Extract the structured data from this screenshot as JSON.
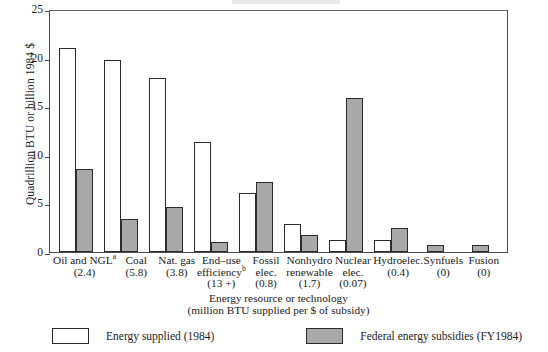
{
  "chart_data": {
    "type": "bar",
    "title": "",
    "xlabel": "Energy resource or technology",
    "xlabel_sub": "(million BTU supplied per $ of subsidy)",
    "ylabel": "Quadrillion BTU or billion 1984 $",
    "ylim": [
      0,
      25
    ],
    "yticks": [
      0,
      5,
      10,
      15,
      20,
      25
    ],
    "grid": false,
    "legend_position": "bottom",
    "categories": [
      "Oil and NGLᵃ",
      "Coal",
      "Nat. gas",
      "End-use efficiencyᵇ",
      "Fossil elec.",
      "Nonhydro renewable",
      "Nuclear elec.",
      "Hydroelec.",
      "Synfuels",
      "Fusion"
    ],
    "category_sublabels": [
      "(2.4)",
      "(5.8)",
      "(3.8)",
      "(13+)",
      "(0.8)",
      "(1.7)",
      "(0.07)",
      "(0.4)",
      "(0)",
      "(0)"
    ],
    "series": [
      {
        "name": "Energy supplied (1984)",
        "color": "#ffffff",
        "values": [
          21.0,
          19.8,
          17.9,
          11.3,
          6.1,
          2.9,
          1.2,
          1.2,
          0,
          0
        ]
      },
      {
        "name": "Federal energy subsidies (FY1984)",
        "color": "#a8a8a8",
        "values": [
          8.5,
          3.4,
          4.6,
          1.0,
          7.2,
          1.7,
          15.8,
          2.5,
          0.7,
          0.7
        ]
      }
    ]
  },
  "axis": {
    "y_title": "Quadrillion BTU or billion 1984 $",
    "x_title_line1": "Energy resource or technology",
    "x_title_line2": "(million BTU supplied per $ of subsidy)",
    "ticks": [
      "0",
      "5",
      "10",
      "15",
      "20",
      "25"
    ]
  },
  "categories": [
    {
      "name_main": "Oil and NGL",
      "name_sup": "a",
      "sub": "(2.4)"
    },
    {
      "name_main": "Coal",
      "name_sup": "",
      "sub": "(5.8)"
    },
    {
      "name_main": "Nat. gas",
      "name_sup": "",
      "sub": "(3.8)"
    },
    {
      "name_main": "End–use",
      "name_main2": "efficiency",
      "name_sup": "b",
      "sub": "(13 +)"
    },
    {
      "name_main": "Fossil",
      "name_main2": "elec.",
      "name_sup": "",
      "sub": "(0.8)"
    },
    {
      "name_main": "Nonhydro",
      "name_main2": "renewable",
      "name_sup": "",
      "sub": "(1.7)"
    },
    {
      "name_main": "Nuclear",
      "name_main2": "elec.",
      "name_sup": "",
      "sub": "(0.07)"
    },
    {
      "name_main": "Hydroelec.",
      "name_sup": "",
      "sub": "(0.4)"
    },
    {
      "name_main": "Synfuels",
      "name_sup": "",
      "sub": "(0)"
    },
    {
      "name_main": "Fusion",
      "name_sup": "",
      "sub": "(0)"
    }
  ],
  "legend": {
    "items": [
      {
        "label": "Energy supplied (1984)",
        "swatch": "white"
      },
      {
        "label": "Federal energy subsidies (FY1984)",
        "swatch": "gray"
      }
    ]
  }
}
